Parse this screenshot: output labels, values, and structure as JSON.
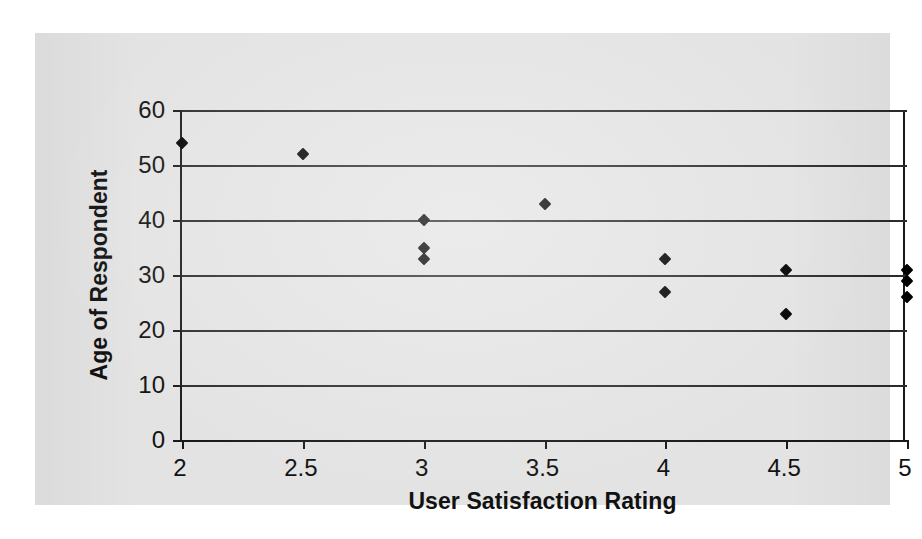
{
  "figure": {
    "panel_background": "#e3e3e3",
    "page_background": "#ffffff",
    "axis_color": "#1a1a1a",
    "grid_color": "#2b2b2b",
    "marker_color": "#000000"
  },
  "chart_data": {
    "type": "scatter",
    "title": "",
    "xlabel": "User Satisfaction Rating",
    "ylabel": "Age of Respondent",
    "xlim": [
      2,
      5
    ],
    "ylim": [
      0,
      60
    ],
    "xticks": [
      2,
      2.5,
      3,
      3.5,
      4,
      4.5,
      5
    ],
    "xtick_labels": [
      "2",
      "2.5",
      "3",
      "3.5",
      "4",
      "4.5",
      "5"
    ],
    "yticks": [
      0,
      10,
      20,
      30,
      40,
      50,
      60
    ],
    "ytick_labels": [
      "0",
      "10",
      "20",
      "30",
      "40",
      "50",
      "60"
    ],
    "grid": "horizontal",
    "gridlines_at": [
      10,
      20,
      30,
      40,
      50,
      60
    ],
    "legend": null,
    "marker": "diamond",
    "points": [
      {
        "x": 2,
        "y": 54
      },
      {
        "x": 2.5,
        "y": 52
      },
      {
        "x": 3,
        "y": 40
      },
      {
        "x": 3,
        "y": 35
      },
      {
        "x": 3,
        "y": 33
      },
      {
        "x": 3.5,
        "y": 43
      },
      {
        "x": 4,
        "y": 33
      },
      {
        "x": 4,
        "y": 27
      },
      {
        "x": 4.5,
        "y": 31
      },
      {
        "x": 4.5,
        "y": 23
      },
      {
        "x": 5,
        "y": 31
      },
      {
        "x": 5,
        "y": 29
      },
      {
        "x": 5,
        "y": 26
      }
    ]
  }
}
